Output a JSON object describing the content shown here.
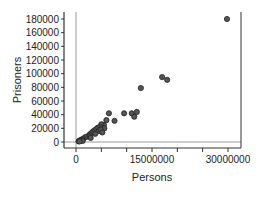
{
  "chart_data": {
    "type": "scatter",
    "title": "",
    "xlabel": "Persons",
    "ylabel": "Prisoners",
    "xlim": [
      -2500000,
      33000000
    ],
    "ylim": [
      -8000,
      182000
    ],
    "x_ticks": [
      0,
      15000000,
      30000000
    ],
    "x_tick_labels": [
      "0",
      "15000000",
      "30000000"
    ],
    "y_ticks": [
      0,
      20000,
      40000,
      60000,
      80000,
      100000,
      120000,
      140000,
      160000,
      180000
    ],
    "y_tick_labels": [
      "0",
      "20000",
      "40000",
      "60000",
      "80000",
      "100000",
      "120000",
      "140000",
      "160000",
      "180000"
    ],
    "grid": false,
    "reference_lines": {
      "x": 0,
      "y": 0
    },
    "series": [
      {
        "name": "States",
        "marker_color": "#555555",
        "points": [
          [
            29800000,
            180000
          ],
          [
            17000000,
            95000
          ],
          [
            18000000,
            91000
          ],
          [
            12800000,
            79000
          ],
          [
            6500000,
            42000
          ],
          [
            9500000,
            42000
          ],
          [
            11000000,
            42000
          ],
          [
            12000000,
            44000
          ],
          [
            11500000,
            37000
          ],
          [
            6000000,
            32000
          ],
          [
            7600000,
            31000
          ],
          [
            5500000,
            25000
          ],
          [
            5000000,
            26000
          ],
          [
            4800000,
            22000
          ],
          [
            4300000,
            21000
          ],
          [
            4000000,
            19000
          ],
          [
            5600000,
            20000
          ],
          [
            3600000,
            17000
          ],
          [
            3300000,
            15000
          ],
          [
            4500000,
            16000
          ],
          [
            3000000,
            13000
          ],
          [
            2700000,
            11000
          ],
          [
            3800000,
            12000
          ],
          [
            2500000,
            9000
          ],
          [
            2200000,
            8000
          ],
          [
            1800000,
            7000
          ],
          [
            1500000,
            5000
          ],
          [
            1200000,
            4000
          ],
          [
            1000000,
            3000
          ],
          [
            800000,
            2500
          ],
          [
            600000,
            1500
          ],
          [
            500000,
            1000
          ],
          [
            1300000,
            1500
          ],
          [
            700000,
            800
          ],
          [
            4900000,
            18000
          ],
          [
            5200000,
            14000
          ],
          [
            2900000,
            6000
          ]
        ]
      }
    ]
  }
}
